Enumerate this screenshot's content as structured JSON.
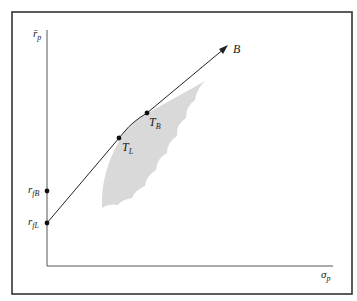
{
  "diagram": {
    "y_axis_label": "r̄",
    "y_axis_subscript": "p",
    "x_axis_label": "σ",
    "x_axis_subscript": "p",
    "points": [
      {
        "id": "rfL",
        "label": "r",
        "sub": "fL"
      },
      {
        "id": "rfB",
        "label": "r",
        "sub": "fB"
      },
      {
        "id": "TL",
        "label": "T",
        "sub": "L"
      },
      {
        "id": "TB",
        "label": "T",
        "sub": "B"
      }
    ],
    "line_end_label": "B",
    "colors": {
      "frame": "#333333",
      "axes": "#555555",
      "region": "#d9d9d9",
      "line": "#222222"
    }
  }
}
